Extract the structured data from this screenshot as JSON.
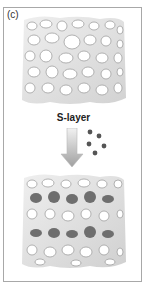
{
  "figure": {
    "panel_label": "(c)",
    "step_label": "S-layer",
    "colors": {
      "frame": "#a8a8a8",
      "scaffold": "#dcdcdc",
      "pore": "#ffffff",
      "pore_shadow": "#9a9a9a",
      "filled_pore": "#6e6e6e",
      "particle": "#555555",
      "arrow_top": "#f2f2f2",
      "arrow_bottom": "#a0a0a0"
    },
    "top_scaffold": {
      "description": "porous scaffold before S-layer coating",
      "filled_pores": 0
    },
    "bottom_scaffold": {
      "description": "porous scaffold after S-layer assembly with filled pores",
      "filled_rows": 2,
      "filled_pores_per_row": 5
    },
    "particles_count": 5
  }
}
